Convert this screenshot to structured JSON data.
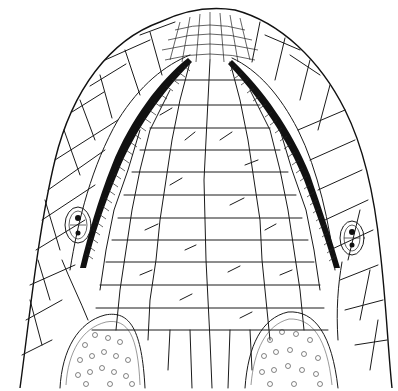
{
  "figure": {
    "ink_color": "#111111",
    "background_color": "#ffffff",
    "labels": []
  }
}
